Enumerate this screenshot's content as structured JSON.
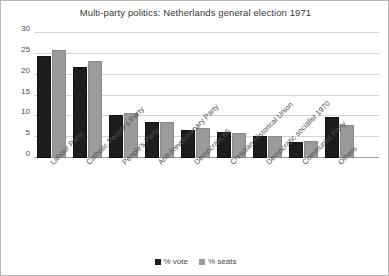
{
  "chart_data": {
    "type": "bar",
    "title": "Multi-party politics: Netherlands general election 1971",
    "xlabel": "",
    "ylabel": "",
    "ylim": [
      0,
      30
    ],
    "yticks": [
      0,
      5,
      10,
      15,
      20,
      25,
      30
    ],
    "grid": true,
    "legend_position": "bottom",
    "categories": [
      "Labour Party",
      "Catholic People's Party",
      "People's Party",
      "Anti-Revolutionary Party",
      "Democrats 66",
      "Christian Historical Union",
      "Democratic socialist 1970",
      "Communist Party",
      "Others"
    ],
    "series": [
      {
        "name": "% vote",
        "color": "#1d1d1d",
        "values": [
          24.6,
          21.9,
          10.3,
          8.6,
          6.8,
          6.3,
          5.3,
          3.9,
          9.8
        ]
      },
      {
        "name": "% seats",
        "color": "#9a9a9a",
        "values": [
          26.0,
          23.3,
          10.7,
          8.7,
          7.3,
          6.0,
          5.3,
          4.0,
          8.0
        ]
      }
    ]
  },
  "legend": {
    "items": [
      {
        "label": "% vote",
        "color": "#1d1d1d"
      },
      {
        "label": "% seats",
        "color": "#9a9a9a"
      }
    ]
  }
}
